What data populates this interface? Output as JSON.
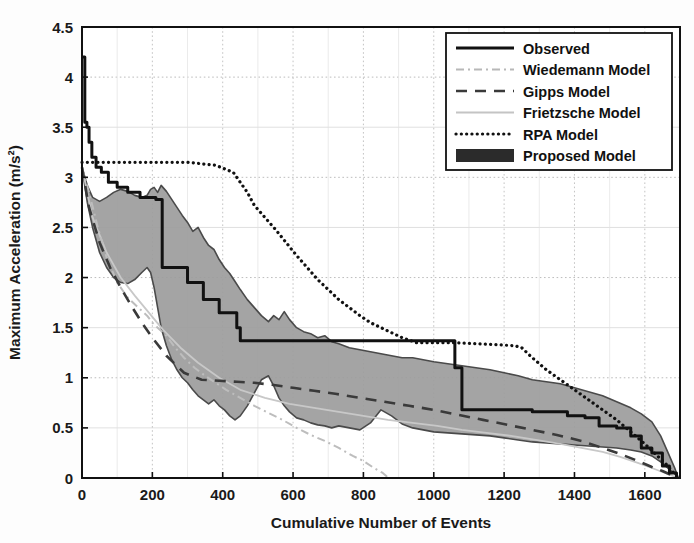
{
  "chart_data": {
    "type": "line",
    "title": "",
    "xlabel": "Cumulative Number of Events",
    "ylabel": "Maximum Acceleration (m/s²)",
    "xlim": [
      0,
      1700
    ],
    "ylim": [
      0,
      4.5
    ],
    "xticks": [
      0,
      200,
      400,
      600,
      800,
      1000,
      1200,
      1400,
      1600
    ],
    "yticks": [
      0,
      0.5,
      1,
      1.5,
      2,
      2.5,
      3,
      3.5,
      4,
      4.5
    ],
    "xtick_labels": [
      "0",
      "200",
      "400",
      "600",
      "800",
      "1000",
      "1200",
      "1400",
      "1600"
    ],
    "ytick_labels": [
      "0",
      "0.5",
      "1",
      "1.5",
      "2",
      "2.5",
      "3",
      "3.5",
      "4",
      "4.5"
    ],
    "grid": true,
    "legend_position": "top-right",
    "legend_entries": [
      {
        "label": "Observed",
        "style": "solid-thick",
        "color": "#111111"
      },
      {
        "label": "Wiedemann Model",
        "style": "dash-dot-light",
        "color": "#b8b8b8"
      },
      {
        "label": "Gipps Model",
        "style": "dashed",
        "color": "#3a3a3a"
      },
      {
        "label": "Frietzsche Model",
        "style": "solid-light",
        "color": "#c4c4c4"
      },
      {
        "label": "RPA Model",
        "style": "dotted",
        "color": "#111111"
      },
      {
        "label": "Proposed Model",
        "style": "filled-band",
        "color": "#2b2b2b"
      }
    ],
    "series": [
      {
        "name": "Observed",
        "style": "solid-thick",
        "color": "#111111",
        "step": true,
        "x": [
          0,
          8,
          14,
          20,
          28,
          40,
          55,
          75,
          100,
          130,
          165,
          200,
          210,
          225,
          228,
          255,
          285,
          300,
          320,
          345,
          360,
          390,
          410,
          440,
          450,
          520,
          600,
          700,
          800,
          900,
          940,
          950,
          1060,
          1080,
          1200,
          1260,
          1280,
          1380,
          1430,
          1470,
          1520,
          1560,
          1590,
          1620,
          1650,
          1670,
          1690
        ],
        "y": [
          4.2,
          3.55,
          3.5,
          3.35,
          3.2,
          3.1,
          3.05,
          2.95,
          2.9,
          2.85,
          2.8,
          2.8,
          2.78,
          2.78,
          2.1,
          2.1,
          2.1,
          1.95,
          1.95,
          1.78,
          1.78,
          1.65,
          1.65,
          1.5,
          1.37,
          1.37,
          1.37,
          1.37,
          1.37,
          1.37,
          1.37,
          1.37,
          1.1,
          0.68,
          0.68,
          0.68,
          0.66,
          0.62,
          0.6,
          0.52,
          0.5,
          0.42,
          0.3,
          0.25,
          0.12,
          0.05,
          0.0
        ]
      },
      {
        "name": "Wiedemann Model",
        "style": "dash-dot-light",
        "color": "#bdbdbd",
        "x": [
          0,
          20,
          45,
          70,
          100,
          130,
          160,
          185,
          200,
          215,
          240,
          265,
          290,
          320,
          350,
          380,
          410,
          450,
          490,
          530,
          570,
          610,
          650,
          690,
          730,
          770,
          800,
          830,
          855,
          865,
          870
        ],
        "y": [
          3.1,
          2.85,
          2.5,
          2.2,
          1.95,
          1.8,
          1.7,
          1.62,
          1.55,
          1.5,
          1.42,
          1.3,
          1.2,
          1.1,
          1.02,
          0.95,
          0.88,
          0.8,
          0.72,
          0.65,
          0.58,
          0.5,
          0.43,
          0.37,
          0.3,
          0.22,
          0.17,
          0.1,
          0.05,
          0.02,
          0.0
        ]
      },
      {
        "name": "Gipps Model",
        "style": "dashed",
        "color": "#3a3a3a",
        "x": [
          0,
          20,
          50,
          80,
          110,
          140,
          170,
          200,
          240,
          290,
          340,
          390,
          440,
          490,
          540,
          600,
          660,
          720,
          790,
          860,
          930,
          1000,
          1070,
          1140,
          1210,
          1280,
          1350,
          1420,
          1480,
          1530,
          1580,
          1620,
          1650,
          1675,
          1690
        ],
        "y": [
          3.1,
          2.7,
          2.35,
          2.1,
          1.9,
          1.72,
          1.55,
          1.4,
          1.22,
          1.05,
          0.98,
          0.97,
          0.96,
          0.95,
          0.93,
          0.9,
          0.87,
          0.84,
          0.8,
          0.76,
          0.72,
          0.68,
          0.63,
          0.58,
          0.53,
          0.48,
          0.43,
          0.37,
          0.3,
          0.24,
          0.17,
          0.11,
          0.07,
          0.03,
          0.0
        ]
      },
      {
        "name": "Frietzsche Model",
        "style": "solid-light",
        "color": "#c8c8c8",
        "x": [
          0,
          30,
          70,
          110,
          150,
          190,
          230,
          280,
          330,
          390,
          450,
          520,
          590,
          660,
          730,
          800,
          870,
          940,
          1010,
          1080,
          1150,
          1220,
          1290,
          1360,
          1420,
          1480,
          1530,
          1580,
          1620,
          1650,
          1680,
          1695
        ],
        "y": [
          3.1,
          2.6,
          2.25,
          2.0,
          1.82,
          1.65,
          1.48,
          1.3,
          1.15,
          1.0,
          0.88,
          0.8,
          0.74,
          0.7,
          0.66,
          0.62,
          0.58,
          0.55,
          0.52,
          0.48,
          0.45,
          0.42,
          0.38,
          0.34,
          0.3,
          0.26,
          0.21,
          0.15,
          0.1,
          0.06,
          0.02,
          0.0
        ]
      },
      {
        "name": "RPA Model",
        "style": "dotted",
        "color": "#111111",
        "x": [
          0,
          30,
          80,
          150,
          220,
          300,
          380,
          430,
          450,
          470,
          490,
          520,
          550,
          580,
          610,
          640,
          670,
          700,
          730,
          760,
          790,
          820,
          850,
          880,
          910,
          935,
          950,
          1000,
          1060,
          1120,
          1180,
          1230,
          1250,
          1280,
          1320,
          1360,
          1400,
          1440,
          1480,
          1520,
          1560,
          1600,
          1630,
          1660,
          1680,
          1695
        ],
        "y": [
          3.15,
          3.15,
          3.15,
          3.15,
          3.15,
          3.15,
          3.12,
          3.05,
          2.95,
          2.85,
          2.72,
          2.6,
          2.48,
          2.35,
          2.22,
          2.1,
          1.98,
          1.88,
          1.78,
          1.7,
          1.62,
          1.55,
          1.5,
          1.45,
          1.4,
          1.37,
          1.35,
          1.35,
          1.35,
          1.34,
          1.33,
          1.32,
          1.3,
          1.2,
          1.08,
          0.98,
          0.88,
          0.78,
          0.68,
          0.58,
          0.46,
          0.34,
          0.24,
          0.14,
          0.06,
          0.0
        ]
      }
    ],
    "band": {
      "name": "Proposed Model",
      "fill_color": "#9c9c9c",
      "edge_color": "#4a4a4a",
      "x": [
        0,
        15,
        30,
        50,
        70,
        90,
        110,
        130,
        150,
        170,
        185,
        195,
        205,
        215,
        225,
        240,
        255,
        270,
        285,
        300,
        315,
        330,
        345,
        360,
        375,
        390,
        405,
        420,
        435,
        450,
        470,
        490,
        510,
        530,
        545,
        560,
        575,
        590,
        610,
        630,
        650,
        670,
        690,
        710,
        730,
        760,
        790,
        820,
        850,
        880,
        910,
        940,
        970,
        1000,
        1040,
        1080,
        1120,
        1160,
        1200,
        1240,
        1280,
        1320,
        1360,
        1400,
        1440,
        1480,
        1520,
        1560,
        1590,
        1620,
        1645,
        1665,
        1685,
        1695
      ],
      "upper": [
        3.1,
        2.92,
        2.8,
        2.76,
        2.8,
        2.85,
        2.88,
        2.86,
        2.82,
        2.8,
        2.82,
        2.88,
        2.9,
        2.85,
        2.92,
        2.86,
        2.78,
        2.7,
        2.62,
        2.55,
        2.46,
        2.5,
        2.4,
        2.32,
        2.28,
        2.18,
        2.1,
        2.04,
        1.96,
        1.88,
        1.78,
        1.7,
        1.62,
        1.56,
        1.62,
        1.58,
        1.66,
        1.58,
        1.5,
        1.46,
        1.44,
        1.4,
        1.42,
        1.36,
        1.34,
        1.3,
        1.28,
        1.26,
        1.24,
        1.22,
        1.2,
        1.2,
        1.18,
        1.16,
        1.14,
        1.12,
        1.1,
        1.08,
        1.05,
        1.02,
        0.98,
        0.96,
        0.94,
        0.9,
        0.86,
        0.82,
        0.76,
        0.7,
        0.64,
        0.56,
        0.42,
        0.26,
        0.1,
        0.0
      ],
      "lower": [
        3.1,
        2.75,
        2.5,
        2.25,
        2.1,
        2.0,
        1.95,
        1.94,
        1.98,
        2.05,
        2.1,
        2.05,
        1.9,
        1.7,
        1.5,
        1.32,
        1.18,
        1.08,
        1.0,
        0.95,
        0.88,
        0.82,
        0.78,
        0.74,
        0.78,
        0.72,
        0.68,
        0.62,
        0.58,
        0.62,
        0.72,
        0.85,
        0.98,
        1.02,
        0.92,
        0.8,
        0.72,
        0.66,
        0.6,
        0.58,
        0.55,
        0.53,
        0.52,
        0.5,
        0.52,
        0.5,
        0.48,
        0.55,
        0.68,
        0.62,
        0.54,
        0.5,
        0.48,
        0.46,
        0.45,
        0.44,
        0.43,
        0.42,
        0.4,
        0.38,
        0.36,
        0.35,
        0.34,
        0.33,
        0.32,
        0.31,
        0.3,
        0.28,
        0.26,
        0.22,
        0.16,
        0.1,
        0.04,
        0.0
      ]
    }
  }
}
